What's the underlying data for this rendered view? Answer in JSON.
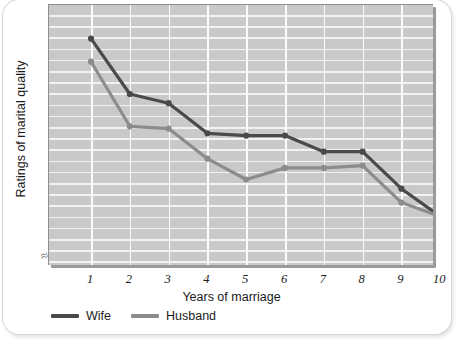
{
  "chart_data": {
    "type": "line",
    "title": "",
    "xlabel": "Years of marriage",
    "ylabel": "Ratings of marital quality",
    "x": [
      1,
      2,
      3,
      4,
      5,
      6,
      7,
      8,
      9,
      10
    ],
    "xtick_labels": [
      "1",
      "2",
      "3",
      "4",
      "5",
      "6",
      "7",
      "8",
      "9",
      "10"
    ],
    "ytick_labels": [],
    "ylim": [
      0,
      100
    ],
    "y_axis_numeric": false,
    "axis_break": true,
    "axis_break_symbol": "≈",
    "grid": true,
    "grid_color": "#f4f4f4",
    "plot_background": "#c9c9c9",
    "legend_position": "bottom-left",
    "series": [
      {
        "name": "Wife",
        "color": "#4a4a4a",
        "marker": "circle",
        "values": [
          95,
          71,
          67,
          54,
          53,
          53,
          46,
          46,
          30,
          18
        ]
      },
      {
        "name": "Husband",
        "color": "#8c8c8c",
        "marker": "circle",
        "values": [
          85,
          57,
          56,
          43,
          34,
          39,
          39,
          40,
          24,
          18
        ]
      }
    ]
  },
  "legend": {
    "items": [
      {
        "label": "Wife",
        "color": "#4a4a4a"
      },
      {
        "label": "Husband",
        "color": "#8c8c8c"
      }
    ]
  }
}
